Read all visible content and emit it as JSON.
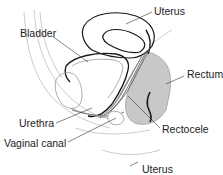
{
  "diagram": {
    "labels": {
      "uterus": "Uterus",
      "bladder": "Bladder",
      "rectum": "Rectum",
      "urethra": "Urethra",
      "vaginal_canal": "Vaginal canal",
      "rectocele": "Rectocele",
      "uterus_second": "Uterus"
    },
    "colors": {
      "outline": "#1a1a1a",
      "soft_tissue_line": "#9a9a9a",
      "rectum_fill": "#c8c8c8",
      "label_text": "#222222",
      "background": "#ffffff"
    }
  }
}
